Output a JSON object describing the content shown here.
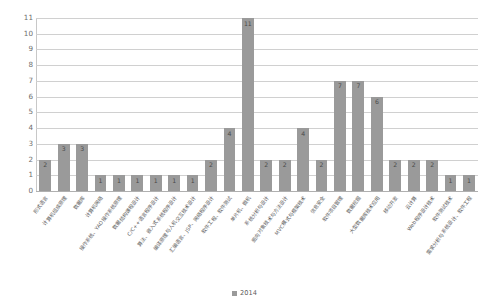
{
  "chart_data": {
    "type": "bar",
    "title": "",
    "xlabel": "",
    "ylabel": "",
    "ylim": [
      0,
      11
    ],
    "ytick_step": 1,
    "yticks": [
      0,
      1,
      2,
      3,
      4,
      5,
      6,
      7,
      8,
      9,
      10,
      11
    ],
    "grid": true,
    "grid_axis": "y",
    "legend_position": "bottom-center",
    "bar_color": "#9a9a9a",
    "series": [
      {
        "name": "2014",
        "values": [
          2,
          3,
          3,
          1,
          1,
          1,
          1,
          1,
          1,
          2,
          4,
          11,
          2,
          2,
          4,
          2,
          7,
          7,
          6,
          2,
          2,
          2,
          1,
          1
        ]
      }
    ],
    "categories": [
      "形式语言",
      "计算机组成原理",
      "数据库",
      "计算机网络",
      "操作系统、YAO操作系统原理",
      "数据结构课程设计",
      "C/C++语言程序设计",
      "算法、嵌入式系统程序设计",
      "编译原理与人机交互技术设计",
      "汇编语言、JSP、网络程序设计",
      "软件工程、软件测试",
      "单片机、微机",
      "系统分析与设计",
      "面向对象技术与方法设计",
      "MVC模式与框架技术",
      "信息安全",
      "软件项目管理",
      "数据挖掘",
      "大型数据库技术应用",
      "移动开发",
      "云计算",
      "Web程序设计技术",
      "软件测试技术",
      "需求分析与系统设计、软件工程"
    ],
    "value_labels": [
      "2",
      "3",
      "3",
      "1",
      "1",
      "1",
      "1",
      "1",
      "1",
      "2",
      "4",
      "11",
      "2",
      "2",
      "4",
      "2",
      "7",
      "7",
      "6",
      "2",
      "2",
      "2",
      "1",
      "1"
    ]
  },
  "legend": {
    "entries": [
      {
        "label": "2014",
        "color": "#9a9a9a"
      }
    ]
  }
}
